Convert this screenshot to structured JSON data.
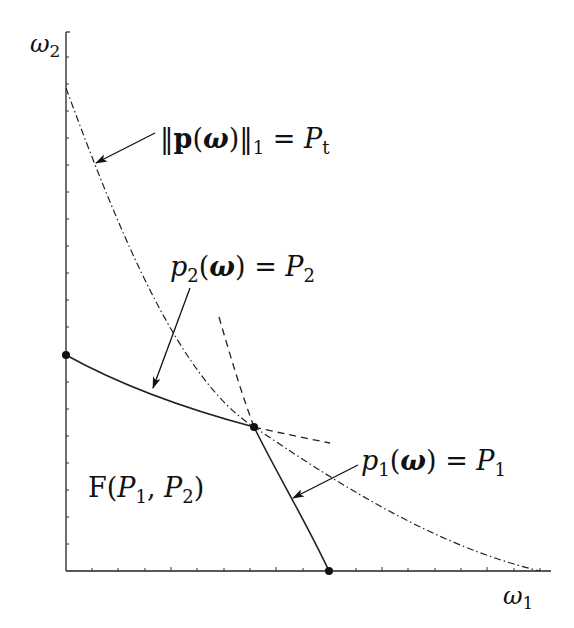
{
  "diagram": {
    "type": "feasible-region-plot",
    "axes": {
      "x_label": {
        "symbol": "ω",
        "subscript": "1"
      },
      "y_label": {
        "symbol": "ω",
        "subscript": "2"
      },
      "x_ticks": 18,
      "y_ticks": 20,
      "tick_labels": "none"
    },
    "labels": {
      "total_power": {
        "norm_open": "‖",
        "vec": "p",
        "paren_open": "(",
        "arg": "ω",
        "paren_close": ")",
        "norm_close": "‖",
        "norm_sub": "1",
        "eq": " = ",
        "rhs": "P",
        "rhs_sub": "t"
      },
      "constraint_2": {
        "lhs": "p",
        "lhs_sub": "2",
        "paren_open": "(",
        "arg": "ω",
        "paren_close": ")",
        "eq": " = ",
        "rhs": "P",
        "rhs_sub": "2"
      },
      "constraint_1": {
        "lhs": "p",
        "lhs_sub": "1",
        "paren_open": "(",
        "arg": "ω",
        "paren_close": ")",
        "eq": " = ",
        "rhs": "P",
        "rhs_sub": "1"
      },
      "region": {
        "name": "F",
        "paren_open": "(",
        "a": "P",
        "a_sub": "1",
        "sep": ", ",
        "b": "P",
        "b_sub": "2",
        "paren_close": ")"
      }
    },
    "curves": [
      {
        "name": "total-power-curve",
        "style": "dash-dot",
        "description": "‖p(ω)‖₁ = P_t boundary"
      },
      {
        "name": "p2-constraint-curve",
        "style": "solid",
        "description": "p₂(ω) = P₂ boundary of region"
      },
      {
        "name": "p2-constraint-extension",
        "style": "dashed"
      },
      {
        "name": "p1-constraint-curve",
        "style": "solid",
        "description": "p₁(ω) = P₁ boundary of region"
      },
      {
        "name": "p1-constraint-extension",
        "style": "dashed"
      }
    ],
    "points": [
      {
        "name": "y-intercept-point",
        "desc": "p2 curve meets ω2 axis"
      },
      {
        "name": "intersection-point",
        "desc": "p1 and p2 curves intersect on total-power curve"
      },
      {
        "name": "x-intercept-point",
        "desc": "p1 curve meets ω1 axis"
      }
    ],
    "colors": {
      "ink": "#111111",
      "background": "#ffffff"
    }
  }
}
